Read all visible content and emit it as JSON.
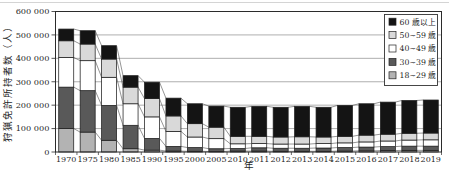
{
  "figure": {
    "background": "#ffffff",
    "top_rule_color": "#d4d4d4"
  },
  "chart_data": {
    "type": "bar",
    "stacked": true,
    "title": "",
    "xlabel": "年",
    "ylabel": "狩猟免許所持者数（人）",
    "categories": [
      "1970",
      "1975",
      "1980",
      "1985",
      "1990",
      "1995",
      "2000",
      "2005",
      "2010",
      "2011",
      "2012",
      "2013",
      "2014",
      "2015",
      "2016",
      "2017",
      "2018",
      "2019"
    ],
    "series": [
      {
        "name": "18~29 歳",
        "color": "#b3b3b3",
        "values": [
          100000,
          85000,
          50000,
          14000,
          8000,
          4000,
          3000,
          2000,
          4000,
          4000,
          3000,
          3000,
          3000,
          4000,
          5000,
          6000,
          7000,
          7000
        ]
      },
      {
        "name": "30~39 歳",
        "color": "#595959",
        "values": [
          177000,
          177000,
          149000,
          100000,
          50000,
          20000,
          16000,
          12000,
          11000,
          14000,
          13000,
          13000,
          14000,
          15000,
          16000,
          17000,
          18000,
          18000
        ]
      },
      {
        "name": "40~49 歳",
        "color": "#ffffff",
        "values": [
          127000,
          128000,
          120000,
          92000,
          92000,
          64000,
          45000,
          43000,
          20000,
          18000,
          18000,
          18000,
          19000,
          20000,
          22000,
          24000,
          26000,
          27000
        ]
      },
      {
        "name": "50~59 歳",
        "color": "#d9d9d9",
        "values": [
          71000,
          71000,
          78000,
          71000,
          78000,
          66000,
          57000,
          49000,
          32000,
          31000,
          30000,
          31000,
          28000,
          28000,
          29000,
          29000,
          29000,
          29000
        ]
      },
      {
        "name": "60 歳以上",
        "color": "#141414",
        "values": [
          50000,
          57000,
          57000,
          49000,
          70000,
          76000,
          85000,
          90000,
          124000,
          128000,
          127000,
          130000,
          127000,
          132000,
          134000,
          137000,
          140000,
          141000
        ]
      }
    ],
    "legend": {
      "position": "top-right",
      "items": [
        "60 歳以上",
        "50~59 歳",
        "40~49 歳",
        "30~39 歳",
        "18~29 歳"
      ],
      "swatch_colors": [
        "#141414",
        "#d9d9d9",
        "#ffffff",
        "#595959",
        "#b3b3b3"
      ]
    },
    "ylim": [
      0,
      600000
    ],
    "ytick_interval": 100000,
    "ytick_labels": [
      "0",
      "100 000",
      "200 000",
      "300 000",
      "400 000",
      "500 000",
      "600 000"
    ],
    "grid": true,
    "connector_lines": true,
    "colors": {
      "axis": "#2b2b2b",
      "grid": "#8c8c8c",
      "bar_border": "#1f1f1f",
      "connector": "#4d4d4d",
      "legend_border": "#333333",
      "text": "#1f1f1f"
    }
  }
}
